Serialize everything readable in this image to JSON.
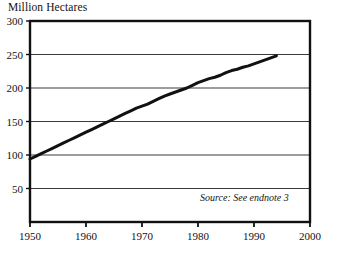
{
  "figure": {
    "title": "Million Hectares",
    "source_note": "Source: See endnote 3",
    "background_color": "#ffffff",
    "line_color": "#111111",
    "axis_color": "#111111",
    "grid_color": "#3a3a3a"
  },
  "chart_data": {
    "type": "line",
    "title": "Million Hectares",
    "xlabel": "",
    "ylabel": "Million Hectares",
    "xlim": [
      1950,
      2000
    ],
    "ylim": [
      0,
      300
    ],
    "grid": "horizontal",
    "legend": "none",
    "annotations": [
      "Source: See endnote 3"
    ],
    "xticks": [
      1950,
      1960,
      1970,
      1980,
      1990,
      2000
    ],
    "xtick_labels": [
      "1950",
      "1960",
      "1970",
      "1980",
      "1990",
      "2000"
    ],
    "yticks": [
      50,
      100,
      150,
      200,
      250,
      300
    ],
    "ytick_labels": [
      "50",
      "100",
      "150",
      "200",
      "250",
      "300"
    ],
    "series": [
      {
        "name": "Irrigated Area",
        "x": [
          1950,
          1951,
          1952,
          1953,
          1954,
          1955,
          1956,
          1957,
          1958,
          1959,
          1960,
          1961,
          1962,
          1963,
          1964,
          1965,
          1966,
          1967,
          1968,
          1969,
          1970,
          1971,
          1972,
          1973,
          1974,
          1975,
          1976,
          1977,
          1978,
          1979,
          1980,
          1981,
          1982,
          1983,
          1984,
          1985,
          1986,
          1987,
          1988,
          1989,
          1990,
          1991,
          1992,
          1993,
          1994
        ],
        "values": [
          94,
          98,
          102,
          106,
          110,
          114,
          118,
          122,
          126,
          130,
          134,
          138,
          142,
          146,
          150,
          154,
          158,
          162,
          166,
          170,
          173,
          176,
          180,
          184,
          188,
          191,
          194,
          197,
          200,
          204,
          208,
          211,
          214,
          216,
          219,
          223,
          226,
          228,
          231,
          233,
          236,
          239,
          242,
          245,
          248
        ]
      }
    ]
  },
  "axes_geometry": {
    "left_px": 30,
    "right_px": 310,
    "top_px": 21,
    "bottom_px": 222
  }
}
